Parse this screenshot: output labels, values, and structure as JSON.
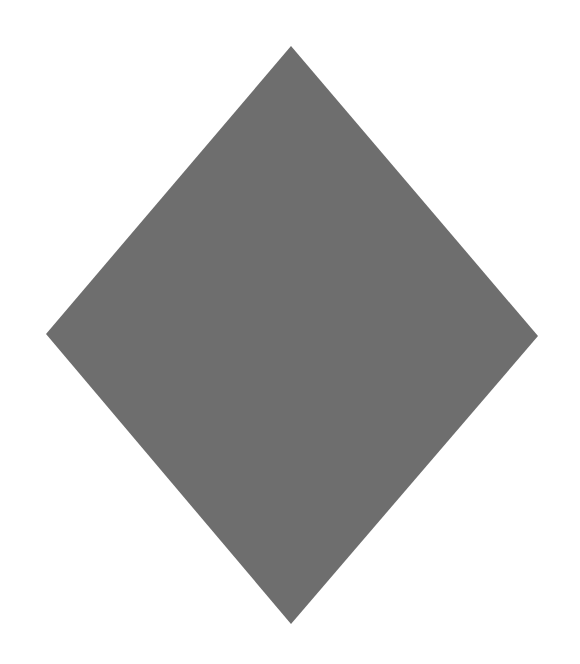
{
  "page": {
    "width": 580,
    "height": 664,
    "background": "#ffffff"
  },
  "shape": {
    "type": "diamond",
    "fill": "#6e6e6e",
    "points": [
      [
        291,
        46
      ],
      [
        538,
        336
      ],
      [
        291,
        624
      ],
      [
        46,
        334
      ]
    ]
  }
}
